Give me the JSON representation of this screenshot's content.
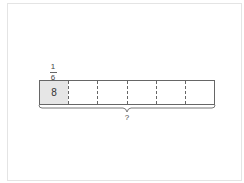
{
  "diagram": {
    "type": "tape-diagram",
    "fraction": {
      "numerator": "1",
      "denominator": "6"
    },
    "cells": [
      {
        "value": "8",
        "shaded": true
      },
      {
        "value": "",
        "shaded": false
      },
      {
        "value": "",
        "shaded": false
      },
      {
        "value": "",
        "shaded": false
      },
      {
        "value": "",
        "shaded": false
      },
      {
        "value": "",
        "shaded": false
      }
    ],
    "total_label": "?",
    "colors": {
      "shaded": "#e6e6e6",
      "border": "#666666"
    }
  }
}
